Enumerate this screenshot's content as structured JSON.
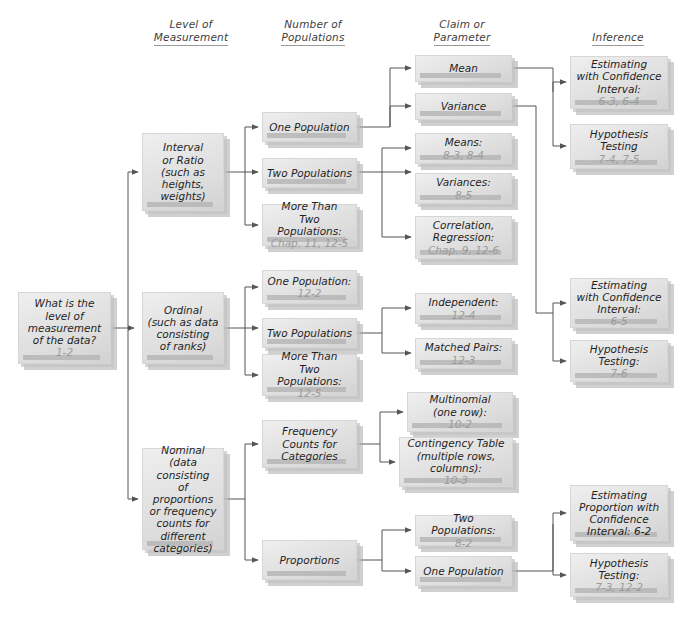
{
  "diagram": {
    "colors": {
      "box_fill_light": "#efefef",
      "box_fill_dark": "#d2d2d2",
      "box_shadow": "#a9a9a9",
      "text": "#1f1f1f",
      "reference_text": "#9b9b9b",
      "line": "#555555",
      "background": "#ffffff"
    }
  },
  "columns": [
    {
      "id": "level-of-measurement",
      "line1": "Level of",
      "line2": "Measurement",
      "x": 141,
      "y": 18
    },
    {
      "id": "number-of-populations",
      "line1": "Number of",
      "line2": "Populations",
      "x": 263,
      "y": 18
    },
    {
      "id": "claim-or-parameter",
      "line1": "Claim or",
      "line2": "Parameter",
      "x": 412,
      "y": 18
    },
    {
      "id": "inference",
      "line1": "Inference",
      "line2": "",
      "x": 568,
      "y": 31
    }
  ],
  "nodes": {
    "start": {
      "id": "start-question",
      "lines": [
        "What is the",
        "level of",
        "measurement",
        "of the data?"
      ],
      "ref": "1-2",
      "x": 18,
      "y": 292,
      "w": 93,
      "h": 72
    },
    "level": [
      {
        "id": "interval-or-ratio",
        "lines": [
          "Interval",
          "or Ratio",
          "(such as",
          "heights,",
          "weights)"
        ],
        "ref": "",
        "x": 142,
        "y": 133,
        "w": 82,
        "h": 78
      },
      {
        "id": "ordinal",
        "lines": [
          "Ordinal",
          "(such as data",
          "consisting",
          "of ranks)"
        ],
        "ref": "",
        "x": 142,
        "y": 292,
        "w": 82,
        "h": 72
      },
      {
        "id": "nominal",
        "lines": [
          "Nominal",
          "(data consisting",
          "of proportions",
          "or frequency",
          "counts for",
          "different",
          "categories)"
        ],
        "ref": "",
        "x": 142,
        "y": 448,
        "w": 82,
        "h": 102
      }
    ],
    "populations": [
      {
        "id": "one-population-interval",
        "lines": [
          "One Population"
        ],
        "ref": "",
        "x": 262,
        "y": 112,
        "w": 95,
        "h": 30
      },
      {
        "id": "two-populations-interval",
        "lines": [
          "Two Populations"
        ],
        "ref": "",
        "x": 262,
        "y": 158,
        "w": 95,
        "h": 30
      },
      {
        "id": "more-than-two-populations-interval",
        "lines": [
          "More Than",
          "Two Populations:"
        ],
        "ref": "Chap. 11, 12-5",
        "x": 262,
        "y": 204,
        "w": 95,
        "h": 42
      },
      {
        "id": "one-population-ordinal",
        "lines": [
          "One Population:"
        ],
        "ref": "12-2",
        "x": 262,
        "y": 270,
        "w": 95,
        "h": 34
      },
      {
        "id": "two-populations-ordinal",
        "lines": [
          "Two Populations"
        ],
        "ref": "",
        "x": 262,
        "y": 318,
        "w": 95,
        "h": 30
      },
      {
        "id": "more-than-two-populations-ordinal",
        "lines": [
          "More Than",
          "Two Populations:"
        ],
        "ref": "12-5",
        "x": 262,
        "y": 354,
        "w": 95,
        "h": 42
      },
      {
        "id": "frequency-counts-for-categories",
        "lines": [
          "Frequency",
          "Counts for",
          "Categories"
        ],
        "ref": "",
        "x": 262,
        "y": 420,
        "w": 95,
        "h": 48
      },
      {
        "id": "proportions",
        "lines": [
          "Proportions"
        ],
        "ref": "",
        "x": 262,
        "y": 540,
        "w": 95,
        "h": 40
      }
    ],
    "claims": [
      {
        "id": "mean",
        "lines": [
          "Mean"
        ],
        "ref": "",
        "x": 415,
        "y": 55,
        "w": 97,
        "h": 27
      },
      {
        "id": "variance",
        "lines": [
          "Variance"
        ],
        "ref": "",
        "x": 415,
        "y": 93,
        "w": 97,
        "h": 27
      },
      {
        "id": "means",
        "lines": [
          "Means:"
        ],
        "ref": "8-3, 8-4",
        "x": 415,
        "y": 133,
        "w": 97,
        "h": 31
      },
      {
        "id": "variances",
        "lines": [
          "Variances:"
        ],
        "ref": "8-5",
        "x": 415,
        "y": 173,
        "w": 97,
        "h": 31
      },
      {
        "id": "correlation-regression",
        "lines": [
          "Correlation,",
          "Regression:"
        ],
        "ref": "Chap. 9, 12-6",
        "x": 415,
        "y": 216,
        "w": 97,
        "h": 43
      },
      {
        "id": "independent",
        "lines": [
          "Independent:"
        ],
        "ref": "12-4",
        "x": 415,
        "y": 293,
        "w": 97,
        "h": 31
      },
      {
        "id": "matched-pairs",
        "lines": [
          "Matched Pairs:"
        ],
        "ref": "12-3",
        "x": 415,
        "y": 338,
        "w": 97,
        "h": 31
      },
      {
        "id": "multinomial",
        "lines": [
          "Multinomial",
          "(one row):"
        ],
        "ref": "10-2",
        "x": 407,
        "y": 392,
        "w": 106,
        "h": 40
      },
      {
        "id": "contingency-table",
        "lines": [
          "Contingency Table",
          "(multiple rows,",
          "columns):"
        ],
        "ref": "10-3",
        "x": 399,
        "y": 437,
        "w": 114,
        "h": 50
      },
      {
        "id": "two-populations-proportion",
        "lines": [
          "Two Populations:"
        ],
        "ref": "8-2",
        "x": 415,
        "y": 515,
        "w": 97,
        "h": 31
      },
      {
        "id": "one-population-proportion",
        "lines": [
          "One Population"
        ],
        "ref": "",
        "x": 415,
        "y": 556,
        "w": 97,
        "h": 30
      }
    ],
    "inference": [
      {
        "id": "estimating-with-ci-1",
        "lines": [
          "Estimating",
          "with Confidence",
          "Interval:"
        ],
        "ref": "6-3, 6-4",
        "x": 570,
        "y": 56,
        "w": 98,
        "h": 53
      },
      {
        "id": "hypothesis-testing-1",
        "lines": [
          "Hypothesis",
          "Testing"
        ],
        "ref": "7-4, 7-5",
        "x": 570,
        "y": 124,
        "w": 98,
        "h": 45
      },
      {
        "id": "estimating-with-ci-2",
        "lines": [
          "Estimating",
          "with Confidence",
          "Interval:"
        ],
        "ref": "6-5",
        "x": 570,
        "y": 278,
        "w": 98,
        "h": 50
      },
      {
        "id": "hypothesis-testing-2",
        "lines": [
          "Hypothesis",
          "Testing:"
        ],
        "ref": "7-6",
        "x": 570,
        "y": 340,
        "w": 98,
        "h": 42
      },
      {
        "id": "estimating-proportion-ci",
        "lines": [
          "Estimating",
          "Proportion with",
          "Confidence",
          "Interval: 6-2"
        ],
        "ref": "",
        "x": 570,
        "y": 485,
        "w": 98,
        "h": 56
      },
      {
        "id": "hypothesis-testing-3",
        "lines": [
          "Hypothesis",
          "Testing:"
        ],
        "ref": "7-3, 12-2",
        "x": 570,
        "y": 553,
        "w": 98,
        "h": 44
      }
    ]
  },
  "edges": [
    {
      "from": "start-question",
      "to": "interval-or-ratio"
    },
    {
      "from": "start-question",
      "to": "ordinal"
    },
    {
      "from": "start-question",
      "to": "nominal"
    },
    {
      "from": "interval-or-ratio",
      "to": "one-population-interval"
    },
    {
      "from": "interval-or-ratio",
      "to": "two-populations-interval"
    },
    {
      "from": "interval-or-ratio",
      "to": "more-than-two-populations-interval"
    },
    {
      "from": "ordinal",
      "to": "one-population-ordinal"
    },
    {
      "from": "ordinal",
      "to": "two-populations-ordinal"
    },
    {
      "from": "ordinal",
      "to": "more-than-two-populations-ordinal"
    },
    {
      "from": "nominal",
      "to": "frequency-counts-for-categories"
    },
    {
      "from": "nominal",
      "to": "proportions"
    },
    {
      "from": "one-population-interval",
      "to": "mean"
    },
    {
      "from": "one-population-interval",
      "to": "variance"
    },
    {
      "from": "two-populations-interval",
      "to": "means"
    },
    {
      "from": "two-populations-interval",
      "to": "variances"
    },
    {
      "from": "two-populations-interval",
      "to": "correlation-regression"
    },
    {
      "from": "two-populations-ordinal",
      "to": "independent"
    },
    {
      "from": "two-populations-ordinal",
      "to": "matched-pairs"
    },
    {
      "from": "frequency-counts-for-categories",
      "to": "multinomial"
    },
    {
      "from": "frequency-counts-for-categories",
      "to": "contingency-table"
    },
    {
      "from": "proportions",
      "to": "two-populations-proportion"
    },
    {
      "from": "proportions",
      "to": "one-population-proportion"
    },
    {
      "from": "mean",
      "to": "estimating-with-ci-1"
    },
    {
      "from": "mean",
      "to": "hypothesis-testing-1"
    },
    {
      "from": "variance",
      "to": "estimating-with-ci-2"
    },
    {
      "from": "variance",
      "to": "hypothesis-testing-2"
    },
    {
      "from": "one-population-proportion",
      "to": "estimating-proportion-ci"
    },
    {
      "from": "one-population-proportion",
      "to": "hypothesis-testing-3"
    }
  ]
}
